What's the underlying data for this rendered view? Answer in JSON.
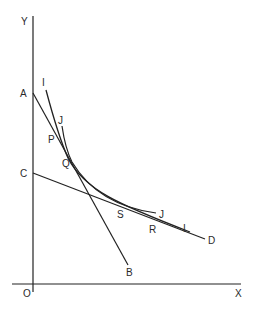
{
  "diagram": {
    "type": "indifference-curve-budget-lines",
    "axes": {
      "x_label": "X",
      "y_label": "Y",
      "origin_label": "O"
    },
    "points": {
      "A": "A",
      "B": "B",
      "C": "C",
      "D": "D",
      "P": "P",
      "Q": "Q",
      "R": "R",
      "S": "S"
    },
    "curve_labels": {
      "I_top": "I",
      "I_bottom": "I",
      "J_top": "J",
      "J_bottom": "J"
    },
    "lines": [
      {
        "name": "AB",
        "from": "A",
        "to": "B"
      },
      {
        "name": "CD",
        "from": "C",
        "to": "D"
      },
      {
        "name": "II",
        "description": "indifference curve I"
      },
      {
        "name": "JJ",
        "description": "curve J"
      }
    ]
  }
}
